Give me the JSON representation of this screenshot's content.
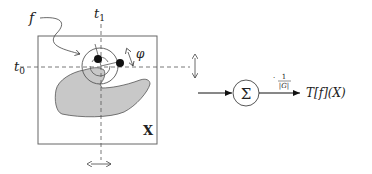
{
  "diagram": {
    "labels": {
      "filter": "f",
      "t1": "t",
      "t1_sub": "1",
      "t0": "t",
      "t0_sub": "0",
      "angle": "φ",
      "image": "X",
      "sum": "Σ",
      "norm_num": "1",
      "norm_den": "|G|",
      "norm_dot": "·",
      "output": "T[f](X)"
    },
    "colors": {
      "stroke": "#555555",
      "shape_fill": "#c8c8c8",
      "dot": "#111111",
      "text": "#222222"
    }
  }
}
